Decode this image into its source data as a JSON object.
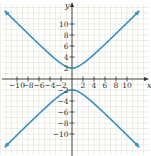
{
  "chart_data": {
    "type": "line",
    "title": "",
    "xlabel": "x",
    "ylabel": "y",
    "xlim": [
      -12.5,
      12.5
    ],
    "ylim": [
      -12.5,
      12.5
    ],
    "grid": true,
    "x_ticks": [
      -10,
      -8,
      -6,
      -4,
      -2,
      2,
      4,
      6,
      8,
      10
    ],
    "y_ticks": [
      10,
      8,
      6,
      4,
      2,
      -2,
      -4,
      -6,
      -8,
      -10
    ],
    "x_tick_labels": [
      "−10",
      "−8",
      "−6",
      "−4",
      "−2",
      "2",
      "4",
      "6",
      "8",
      "10"
    ],
    "y_tick_labels": [
      "10",
      "8",
      "6",
      "4",
      "2",
      "−2",
      "−4",
      "−6",
      "−8",
      "−10"
    ],
    "equation": "y^2 - x^2 = 4",
    "series": [
      {
        "name": "upper branch",
        "x": [
          -12,
          -10,
          -8,
          -6,
          -4,
          -2,
          0,
          2,
          4,
          6,
          8,
          10,
          12
        ],
        "y": [
          12.17,
          10.2,
          8.25,
          6.32,
          4.47,
          2.83,
          2,
          2.83,
          4.47,
          6.32,
          8.25,
          10.2,
          12.17
        ]
      },
      {
        "name": "lower branch",
        "x": [
          -12,
          -10,
          -8,
          -6,
          -4,
          -2,
          0,
          2,
          4,
          6,
          8,
          10,
          12
        ],
        "y": [
          -12.17,
          -10.2,
          -8.25,
          -6.32,
          -4.47,
          -2.83,
          -2,
          -2.83,
          -4.47,
          -6.32,
          -8.25,
          -10.2,
          -12.17
        ]
      }
    ],
    "colors": {
      "curve": "#3a8fc4",
      "grid": "#e3e3d6",
      "axis": "#333333"
    }
  }
}
